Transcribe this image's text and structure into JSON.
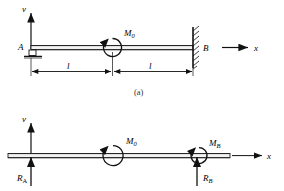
{
  "figure": {
    "caption_a": "(a)",
    "panels": [
      {
        "id": "panel-a",
        "description": "propped cantilever beam with applied moment",
        "axis_v": "v",
        "axis_x": "x",
        "point_a": "A",
        "point_b": "B",
        "moment_label": "M",
        "moment_sub": "0",
        "dim_left": "l",
        "dim_right": "l",
        "support_left": "pin-roller-support",
        "support_right": "fixed-wall-support"
      },
      {
        "id": "panel-b",
        "description": "free body diagram with reactions",
        "axis_v": "v",
        "axis_x": "x",
        "moment_label": "M",
        "moment_sub": "0",
        "moment_b_label": "M",
        "moment_b_sub": "B",
        "reaction_a_label": "R",
        "reaction_a_sub": "A",
        "reaction_b_label": "R",
        "reaction_b_sub": "B"
      }
    ]
  },
  "colors": {
    "ink": "#111111",
    "beam": "#222222",
    "background": "#ffffff"
  }
}
